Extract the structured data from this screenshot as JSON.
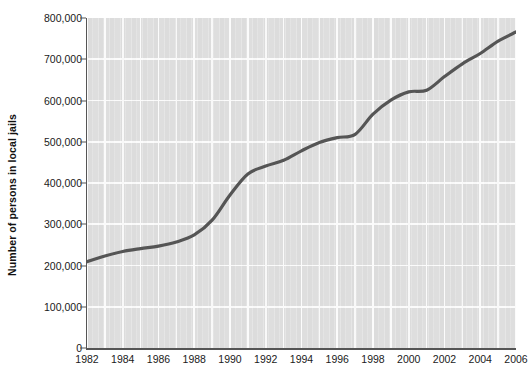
{
  "chart_data": {
    "type": "line",
    "title": "",
    "xlabel": "",
    "ylabel": "Number of persons in local jails",
    "xlim": [
      1982,
      2006
    ],
    "ylim": [
      0,
      800000
    ],
    "grid": true,
    "legend": "none",
    "x_tick_labels": [
      "1982",
      "1984",
      "1986",
      "1988",
      "1990",
      "1992",
      "1994",
      "1996",
      "1998",
      "2000",
      "2002",
      "2004",
      "2006"
    ],
    "x_tick_values": [
      1982,
      1984,
      1986,
      1988,
      1990,
      1992,
      1994,
      1996,
      1998,
      2000,
      2002,
      2004,
      2006
    ],
    "y_tick_labels": [
      "0",
      "100,000",
      "200,000",
      "300,000",
      "400,000",
      "500,000",
      "600,000",
      "700,000",
      "800,000"
    ],
    "y_tick_values": [
      0,
      100000,
      200000,
      300000,
      400000,
      500000,
      600000,
      700000,
      800000
    ],
    "series": [
      {
        "name": "Persons in local jails",
        "color": "#555555",
        "x": [
          1982,
          1983,
          1984,
          1985,
          1986,
          1987,
          1988,
          1989,
          1990,
          1991,
          1992,
          1993,
          1994,
          1995,
          1996,
          1997,
          1998,
          1999,
          2000,
          2001,
          2002,
          2003,
          2004,
          2005,
          2006
        ],
        "values": [
          209000,
          223000,
          234000,
          241000,
          247000,
          257000,
          274000,
          310000,
          371000,
          422000,
          441000,
          455000,
          478000,
          498000,
          510000,
          518000,
          567000,
          601000,
          621000,
          625000,
          658000,
          689000,
          714000,
          744000,
          766000
        ]
      }
    ],
    "colors": {
      "plot_background": "#dedede",
      "gridline": "#fbfbfb",
      "axis": "#555555",
      "line": "#555555",
      "text": "#1a1a1a",
      "page_background": "#ffffff"
    }
  }
}
